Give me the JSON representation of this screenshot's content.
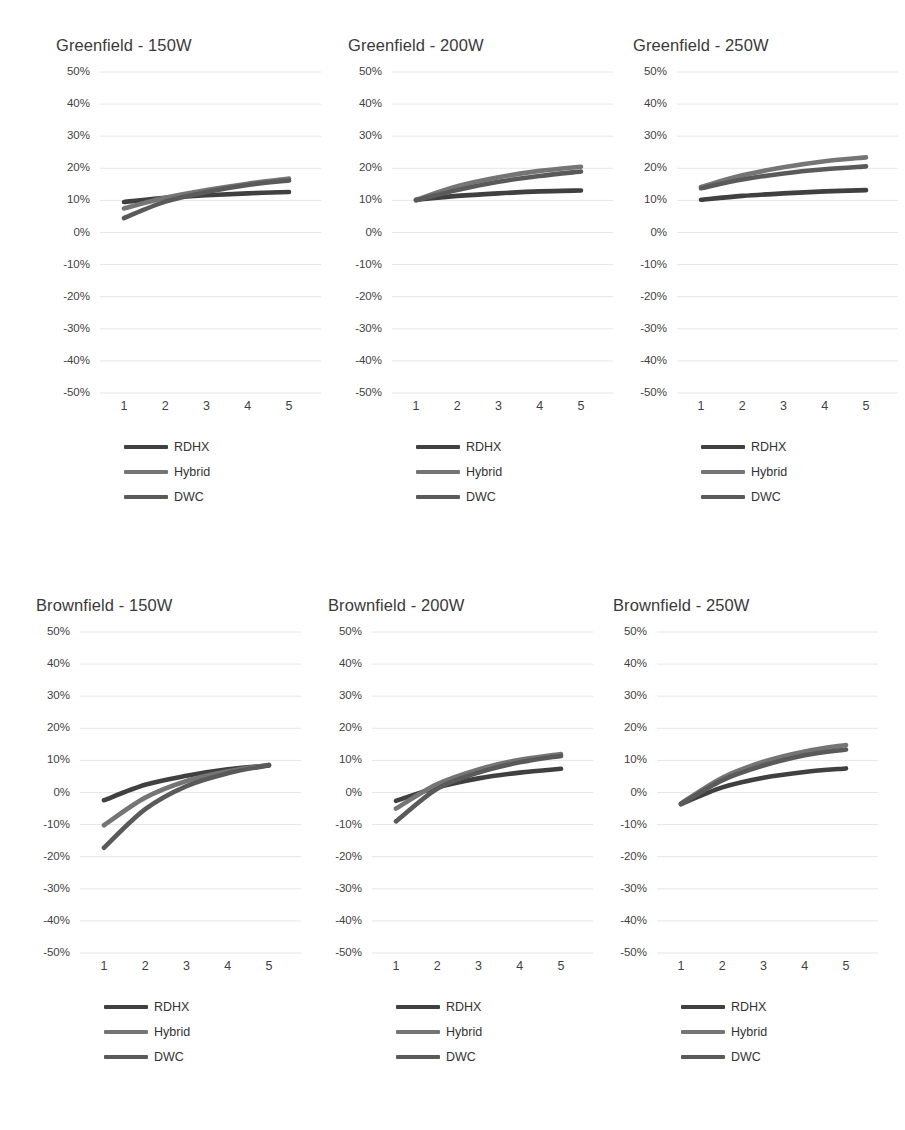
{
  "figure": {
    "background": "#ffffff",
    "gridline_color": "#e6e6e6",
    "text_color": "#3a3a3a"
  },
  "series_styles": [
    {
      "name": "RDHX",
      "color": "#404040"
    },
    {
      "name": "Hybrid",
      "color": "#757575"
    },
    {
      "name": "DWC",
      "color": "#5a5a5a"
    }
  ],
  "legend": {
    "items": [
      {
        "label": "RDHX"
      },
      {
        "label": "Hybrid"
      },
      {
        "label": "DWC"
      }
    ]
  },
  "axis": {
    "y_ticks": [
      "50%",
      "40%",
      "30%",
      "20%",
      "10%",
      "0%",
      "-10%",
      "-20%",
      "-30%",
      "-40%",
      "-50%"
    ],
    "x_ticks": [
      "1",
      "2",
      "3",
      "4",
      "5"
    ],
    "ylim": [
      -50,
      50
    ],
    "xlim": [
      1,
      5
    ]
  },
  "chart_data": [
    {
      "type": "line",
      "title": "Greenfield - 150W",
      "xlabel": "",
      "ylabel": "",
      "x": [
        1,
        2,
        3,
        4,
        5
      ],
      "categories": [
        "1",
        "2",
        "3",
        "4",
        "5"
      ],
      "ylim": [
        -50,
        50
      ],
      "xlim": [
        1,
        5
      ],
      "grid": true,
      "legend_position": "below",
      "yticks": [
        50,
        40,
        30,
        20,
        10,
        0,
        -10,
        -20,
        -30,
        -40,
        -50
      ],
      "series": [
        {
          "name": "RDHX",
          "values": [
            9.5,
            10.8,
            11.6,
            12.2,
            12.6
          ]
        },
        {
          "name": "Hybrid",
          "values": [
            7.5,
            10.8,
            13.2,
            15.2,
            16.8
          ]
        },
        {
          "name": "DWC",
          "values": [
            4.5,
            9.6,
            12.6,
            14.8,
            16.2
          ]
        }
      ]
    },
    {
      "type": "line",
      "title": "Greenfield - 200W",
      "xlabel": "",
      "ylabel": "",
      "x": [
        1,
        2,
        3,
        4,
        5
      ],
      "categories": [
        "1",
        "2",
        "3",
        "4",
        "5"
      ],
      "ylim": [
        -50,
        50
      ],
      "xlim": [
        1,
        5
      ],
      "grid": true,
      "legend_position": "below",
      "yticks": [
        50,
        40,
        30,
        20,
        10,
        0,
        -10,
        -20,
        -30,
        -40,
        -50
      ],
      "series": [
        {
          "name": "RDHX",
          "values": [
            10.2,
            11.4,
            12.2,
            12.8,
            13.1
          ]
        },
        {
          "name": "Hybrid",
          "values": [
            10.2,
            14.4,
            17.2,
            19.2,
            20.5
          ]
        },
        {
          "name": "DWC",
          "values": [
            10.0,
            13.2,
            15.8,
            17.6,
            19.0
          ]
        }
      ]
    },
    {
      "type": "line",
      "title": "Greenfield - 250W",
      "xlabel": "",
      "ylabel": "",
      "x": [
        1,
        2,
        3,
        4,
        5
      ],
      "categories": [
        "1",
        "2",
        "3",
        "4",
        "5"
      ],
      "ylim": [
        -50,
        50
      ],
      "xlim": [
        1,
        5
      ],
      "grid": true,
      "legend_position": "below",
      "yticks": [
        50,
        40,
        30,
        20,
        10,
        0,
        -10,
        -20,
        -30,
        -40,
        -50
      ],
      "series": [
        {
          "name": "RDHX",
          "values": [
            10.2,
            11.4,
            12.2,
            12.8,
            13.2
          ]
        },
        {
          "name": "Hybrid",
          "values": [
            14.2,
            17.8,
            20.3,
            22.2,
            23.4
          ]
        },
        {
          "name": "DWC",
          "values": [
            13.8,
            16.5,
            18.4,
            19.7,
            20.6
          ]
        }
      ]
    },
    {
      "type": "line",
      "title": "Brownfield - 150W",
      "xlabel": "",
      "ylabel": "",
      "x": [
        1,
        2,
        3,
        4,
        5
      ],
      "categories": [
        "1",
        "2",
        "3",
        "4",
        "5"
      ],
      "ylim": [
        -50,
        50
      ],
      "xlim": [
        1,
        5
      ],
      "grid": true,
      "legend_position": "below",
      "yticks": [
        50,
        40,
        30,
        20,
        10,
        0,
        -10,
        -20,
        -30,
        -40,
        -50
      ],
      "series": [
        {
          "name": "RDHX",
          "values": [
            -2.4,
            2.4,
            5.2,
            7.2,
            8.4
          ]
        },
        {
          "name": "Hybrid",
          "values": [
            -10.2,
            -1.6,
            3.6,
            6.6,
            8.6
          ]
        },
        {
          "name": "DWC",
          "values": [
            -17.2,
            -5.2,
            2.0,
            6.0,
            8.5
          ]
        }
      ]
    },
    {
      "type": "line",
      "title": "Brownfield - 200W",
      "xlabel": "",
      "ylabel": "",
      "x": [
        1,
        2,
        3,
        4,
        5
      ],
      "categories": [
        "1",
        "2",
        "3",
        "4",
        "5"
      ],
      "ylim": [
        -50,
        50
      ],
      "xlim": [
        1,
        5
      ],
      "grid": true,
      "legend_position": "below",
      "yticks": [
        50,
        40,
        30,
        20,
        10,
        0,
        -10,
        -20,
        -30,
        -40,
        -50
      ],
      "series": [
        {
          "name": "RDHX",
          "values": [
            -2.6,
            1.6,
            4.4,
            6.2,
            7.4
          ]
        },
        {
          "name": "Hybrid",
          "values": [
            -5.0,
            2.6,
            7.2,
            10.2,
            12.0
          ]
        },
        {
          "name": "DWC",
          "values": [
            -9.0,
            1.2,
            6.2,
            9.4,
            11.4
          ]
        }
      ]
    },
    {
      "type": "line",
      "title": "Brownfield - 250W",
      "xlabel": "",
      "ylabel": "",
      "x": [
        1,
        2,
        3,
        4,
        5
      ],
      "categories": [
        "1",
        "2",
        "3",
        "4",
        "5"
      ],
      "ylim": [
        -50,
        50
      ],
      "xlim": [
        1,
        5
      ],
      "grid": true,
      "legend_position": "below",
      "yticks": [
        50,
        40,
        30,
        20,
        10,
        0,
        -10,
        -20,
        -30,
        -40,
        -50
      ],
      "series": [
        {
          "name": "RDHX",
          "values": [
            -3.6,
            1.6,
            4.6,
            6.4,
            7.5
          ]
        },
        {
          "name": "Hybrid",
          "values": [
            -3.4,
            4.6,
            9.6,
            12.8,
            14.8
          ]
        },
        {
          "name": "DWC",
          "values": [
            -3.6,
            3.8,
            8.4,
            11.6,
            13.4
          ]
        }
      ]
    }
  ],
  "panel_positions": [
    {
      "left": 38,
      "top": 32
    },
    {
      "left": 330,
      "top": 32
    },
    {
      "left": 615,
      "top": 32
    },
    {
      "left": 18,
      "top": 592
    },
    {
      "left": 310,
      "top": 592
    },
    {
      "left": 595,
      "top": 592
    }
  ]
}
